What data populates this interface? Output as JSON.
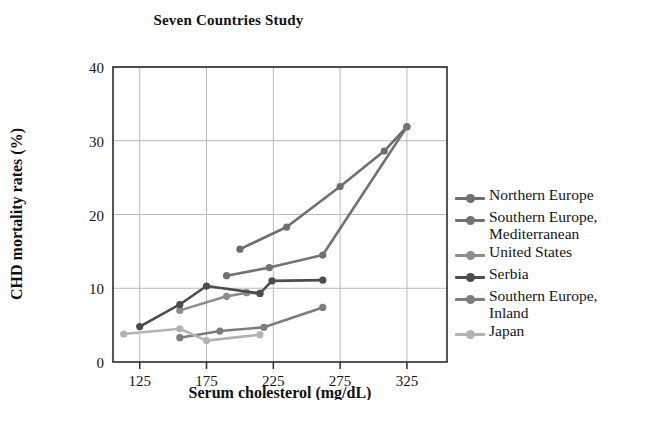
{
  "chart_data": {
    "type": "line",
    "title": "Seven Countries Study",
    "xlabel": "Serum cholesterol (mg/dL)",
    "ylabel": "CHD mortality rates (%)",
    "xlim": [
      105,
      355
    ],
    "ylim": [
      0,
      40
    ],
    "xticks": [
      125,
      175,
      225,
      275,
      325
    ],
    "yticks": [
      0,
      10,
      20,
      30,
      40
    ],
    "grid": true,
    "legend_position": "right",
    "series": [
      {
        "name": "Northern Europe",
        "color": "#6e6e6e",
        "points": [
          {
            "x": 200,
            "y": 15.3
          },
          {
            "x": 235,
            "y": 18.3
          },
          {
            "x": 275,
            "y": 23.8
          },
          {
            "x": 308,
            "y": 28.6
          },
          {
            "x": 325,
            "y": 31.9
          }
        ]
      },
      {
        "name": "Southern Europe,\nMediterranean",
        "color": "#727272",
        "points": [
          {
            "x": 190,
            "y": 11.7
          },
          {
            "x": 222,
            "y": 12.8
          },
          {
            "x": 262,
            "y": 14.5
          },
          {
            "x": 325,
            "y": 31.9
          }
        ]
      },
      {
        "name": "United States",
        "color": "#8c8c8c",
        "points": [
          {
            "x": 155,
            "y": 7.0
          },
          {
            "x": 190,
            "y": 8.9
          },
          {
            "x": 205,
            "y": 9.4
          },
          {
            "x": 215,
            "y": 9.3
          }
        ]
      },
      {
        "name": "Serbia",
        "color": "#4c4c4c",
        "points": [
          {
            "x": 125,
            "y": 4.8
          },
          {
            "x": 155,
            "y": 7.8
          },
          {
            "x": 175,
            "y": 10.3
          },
          {
            "x": 215,
            "y": 9.3
          },
          {
            "x": 224,
            "y": 11.0
          },
          {
            "x": 262,
            "y": 11.1
          }
        ]
      },
      {
        "name": "Southern Europe,\nInland",
        "color": "#7d7d7d",
        "points": [
          {
            "x": 155,
            "y": 3.3
          },
          {
            "x": 185,
            "y": 4.2
          },
          {
            "x": 218,
            "y": 4.7
          },
          {
            "x": 262,
            "y": 7.4
          }
        ]
      },
      {
        "name": "Japan",
        "color": "#b3b3b3",
        "points": [
          {
            "x": 113,
            "y": 3.8
          },
          {
            "x": 155,
            "y": 4.5
          },
          {
            "x": 175,
            "y": 2.9
          },
          {
            "x": 215,
            "y": 3.7
          }
        ]
      }
    ]
  },
  "legend": {
    "items": [
      {
        "label": "Northern Europe",
        "color": "#6e6e6e"
      },
      {
        "label": "Southern Europe,\nMediterranean",
        "color": "#727272"
      },
      {
        "label": "United States",
        "color": "#8c8c8c"
      },
      {
        "label": "Serbia",
        "color": "#4c4c4c"
      },
      {
        "label": "Southern Europe,\nInland",
        "color": "#7d7d7d"
      },
      {
        "label": "Japan",
        "color": "#b3b3b3"
      }
    ]
  },
  "axes": {
    "frame_color": "#2b2b2b",
    "grid_color": "#b9b9b9"
  }
}
